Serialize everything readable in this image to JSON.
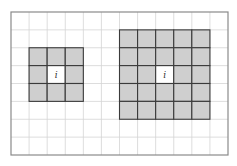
{
  "diagram": {
    "title": "",
    "grid": {
      "columns": 12,
      "rows": 8
    },
    "colors": {
      "background": "#ffffff",
      "grid_line": "#d4d4d4",
      "border": "#8a8a8a",
      "neighbor_fill": "#cfcfcf",
      "neighbor_line": "#3a3a3a",
      "center_fill": "#ffffff"
    },
    "neighborhoods": [
      {
        "name": "neighborhood-3x3",
        "size": 3,
        "center_col": 2,
        "row_start": 2,
        "col_start": 1,
        "center_row": 3,
        "center_label": "i"
      },
      {
        "name": "neighborhood-5x5",
        "size": 5,
        "center_col": 8,
        "row_start": 1,
        "col_start": 6,
        "center_row": 3,
        "center_label": "i"
      }
    ]
  }
}
